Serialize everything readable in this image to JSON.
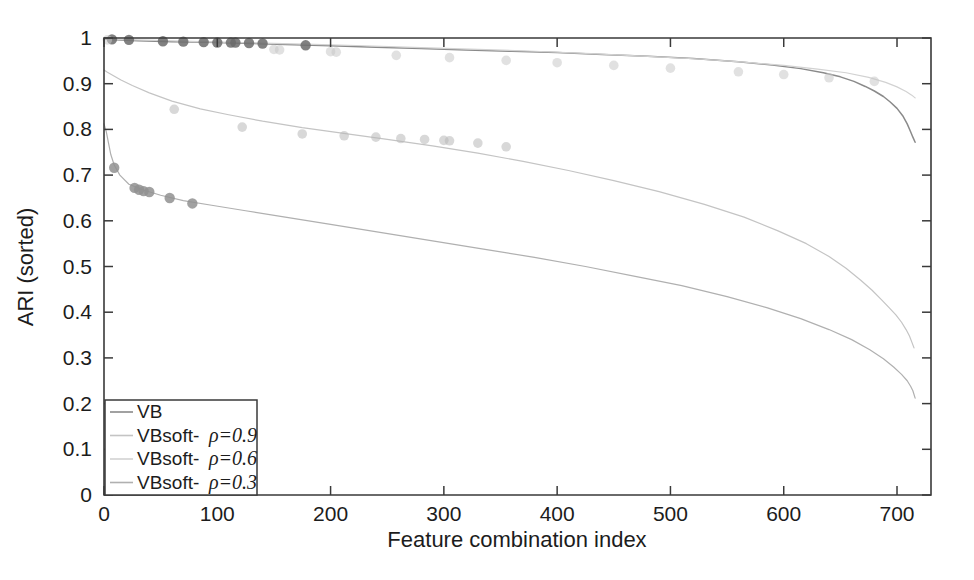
{
  "chart_data": {
    "type": "line",
    "title": "",
    "xlabel": "Feature combination index",
    "ylabel": "ARI (sorted)",
    "xlim": [
      0,
      730
    ],
    "ylim": [
      0,
      1
    ],
    "xticks": [
      "0",
      "100",
      "200",
      "300",
      "400",
      "500",
      "600",
      "700"
    ],
    "xtick_values": [
      0,
      100,
      200,
      300,
      400,
      500,
      600,
      700
    ],
    "yticks": [
      "0",
      "0.1",
      "0.2",
      "0.3",
      "0.4",
      "0.5",
      "0.6",
      "0.7",
      "0.8",
      "0.9",
      "1"
    ],
    "ytick_values": [
      0,
      0.1,
      0.2,
      0.3,
      0.4,
      0.5,
      0.6,
      0.7,
      0.8,
      0.9,
      1
    ],
    "grid": false,
    "legend_position": "lower-left",
    "series": [
      {
        "name": "VB",
        "color": "#8a8a8a",
        "marker": "circle",
        "marker_color": "#6b6b6b",
        "x": [
          0,
          5,
          10,
          20,
          30,
          45,
          60,
          80,
          100,
          130,
          160,
          200,
          240,
          280,
          320,
          360,
          400,
          440,
          480,
          520,
          560,
          590,
          615,
          635,
          650,
          662,
          672,
          680,
          688,
          694,
          700,
          705,
          709,
          712,
          714,
          716
        ],
        "y": [
          0.998,
          0.997,
          0.996,
          0.995,
          0.994,
          0.993,
          0.992,
          0.991,
          0.99,
          0.988,
          0.986,
          0.983,
          0.98,
          0.977,
          0.974,
          0.971,
          0.968,
          0.964,
          0.96,
          0.955,
          0.948,
          0.941,
          0.933,
          0.924,
          0.915,
          0.905,
          0.894,
          0.884,
          0.872,
          0.86,
          0.846,
          0.83,
          0.812,
          0.795,
          0.783,
          0.772
        ],
        "markers_x": [
          7,
          22,
          52,
          70,
          88,
          100,
          112,
          116,
          128,
          140,
          178
        ],
        "markers_y": [
          0.997,
          0.996,
          0.993,
          0.992,
          0.991,
          0.99,
          0.99,
          0.99,
          0.989,
          0.988,
          0.984
        ]
      },
      {
        "name": "VBsoft- ρ=0.9",
        "color": "#c4c4c4",
        "marker": "circle",
        "marker_color": "#b8b8b8",
        "x": [
          0,
          3,
          8,
          15,
          25,
          40,
          60,
          85,
          110,
          140,
          175,
          210,
          250,
          290,
          330,
          370,
          410,
          450,
          490,
          530,
          565,
          595,
          620,
          640,
          655,
          668,
          678,
          686,
          693,
          699,
          704,
          708,
          711,
          713,
          715
        ],
        "y": [
          0.93,
          0.925,
          0.918,
          0.908,
          0.896,
          0.88,
          0.862,
          0.845,
          0.832,
          0.818,
          0.804,
          0.792,
          0.778,
          0.764,
          0.748,
          0.73,
          0.71,
          0.688,
          0.664,
          0.636,
          0.608,
          0.578,
          0.55,
          0.522,
          0.496,
          0.47,
          0.448,
          0.428,
          0.41,
          0.394,
          0.378,
          0.362,
          0.348,
          0.335,
          0.322
        ],
        "markers_x": [
          62,
          122,
          175,
          212,
          240,
          262,
          283,
          300,
          305,
          330,
          355
        ],
        "markers_y": [
          0.844,
          0.805,
          0.79,
          0.786,
          0.783,
          0.78,
          0.778,
          0.776,
          0.775,
          0.77,
          0.762
        ]
      },
      {
        "name": "VBsoft- ρ=0.6",
        "color": "#d2d2d2",
        "marker": "circle",
        "marker_color": "#c8c8c8",
        "x": [
          0,
          5,
          12,
          25,
          45,
          70,
          100,
          140,
          185,
          230,
          280,
          330,
          380,
          430,
          480,
          525,
          565,
          600,
          630,
          655,
          675,
          690,
          700,
          708,
          713,
          716
        ],
        "y": [
          0.999,
          0.998,
          0.997,
          0.996,
          0.995,
          0.993,
          0.991,
          0.989,
          0.986,
          0.983,
          0.979,
          0.975,
          0.971,
          0.966,
          0.96,
          0.954,
          0.947,
          0.94,
          0.932,
          0.924,
          0.914,
          0.903,
          0.893,
          0.883,
          0.875,
          0.869
        ],
        "markers_x": [
          3,
          150,
          155,
          200,
          205,
          258,
          305,
          355,
          400,
          450,
          500,
          560,
          600,
          640,
          680
        ],
        "markers_y": [
          0.996,
          0.975,
          0.974,
          0.97,
          0.969,
          0.962,
          0.957,
          0.951,
          0.946,
          0.94,
          0.934,
          0.926,
          0.92,
          0.913,
          0.905
        ]
      },
      {
        "name": "VBsoft- ρ=0.3",
        "color": "#b0b0b0",
        "marker": "circle",
        "marker_color": "#919191",
        "x": [
          0,
          2,
          4,
          6,
          9,
          14,
          22,
          34,
          50,
          70,
          95,
          125,
          160,
          200,
          245,
          290,
          335,
          380,
          425,
          470,
          510,
          550,
          585,
          615,
          640,
          660,
          676,
          688,
          697,
          704,
          709,
          712,
          714,
          716
        ],
        "y": [
          0.812,
          0.795,
          0.77,
          0.745,
          0.722,
          0.7,
          0.68,
          0.668,
          0.656,
          0.644,
          0.634,
          0.622,
          0.608,
          0.592,
          0.574,
          0.556,
          0.538,
          0.52,
          0.5,
          0.478,
          0.458,
          0.434,
          0.41,
          0.386,
          0.362,
          0.34,
          0.318,
          0.298,
          0.28,
          0.264,
          0.25,
          0.238,
          0.228,
          0.212
        ],
        "markers_x": [
          9,
          27,
          31,
          35,
          40,
          58,
          78
        ],
        "markers_y": [
          0.716,
          0.672,
          0.668,
          0.665,
          0.663,
          0.65,
          0.638
        ]
      }
    ],
    "legend_entries": [
      {
        "label": "VB",
        "rho": "",
        "color": "#8a8a8a"
      },
      {
        "label": "VBsoft-",
        "rho": "=0.9",
        "color": "#c4c4c4"
      },
      {
        "label": "VBsoft-",
        "rho": "=0.6",
        "color": "#d2d2d2"
      },
      {
        "label": "VBsoft-",
        "rho": "=0.3",
        "color": "#b0b0b0"
      }
    ],
    "rho_symbol": "ρ"
  }
}
